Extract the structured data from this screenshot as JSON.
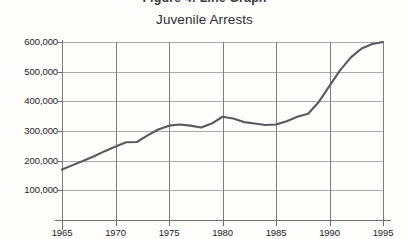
{
  "figure": {
    "caption": "Figure 4: Line Graph"
  },
  "chart_data": {
    "type": "line",
    "title": "Juvenile Arrests",
    "subtitle": "",
    "xlabel": "",
    "ylabel": "",
    "xlim": [
      1965,
      1995
    ],
    "ylim": [
      0,
      600000
    ],
    "grid": true,
    "legend": null,
    "legend_position": "none",
    "line_color": "#5a5a5e",
    "x_tick_labels": [
      "1965",
      "1970",
      "1975",
      "1980",
      "1985",
      "1990",
      "1995"
    ],
    "x_ticks": [
      1965,
      1970,
      1975,
      1980,
      1985,
      1990,
      1995
    ],
    "y_tick_labels": [
      "100,000",
      "200,000",
      "300,000",
      "400,000",
      "500,000",
      "600,000"
    ],
    "y_ticks": [
      100000,
      200000,
      300000,
      400000,
      500000,
      600000
    ],
    "series": [
      {
        "name": "Juvenile Arrests",
        "x": [
          1965,
          1966,
          1967,
          1968,
          1969,
          1970,
          1971,
          1972,
          1973,
          1974,
          1975,
          1976,
          1977,
          1978,
          1979,
          1980,
          1981,
          1982,
          1983,
          1984,
          1985,
          1986,
          1987,
          1988,
          1989,
          1990,
          1991,
          1992,
          1993,
          1994,
          1995
        ],
        "values": [
          170000,
          185000,
          200000,
          215000,
          232000,
          248000,
          262000,
          263000,
          285000,
          305000,
          318000,
          322000,
          318000,
          312000,
          325000,
          348000,
          342000,
          330000,
          325000,
          320000,
          322000,
          333000,
          348000,
          358000,
          398000,
          452000,
          505000,
          548000,
          578000,
          593000,
          600000
        ]
      }
    ]
  }
}
